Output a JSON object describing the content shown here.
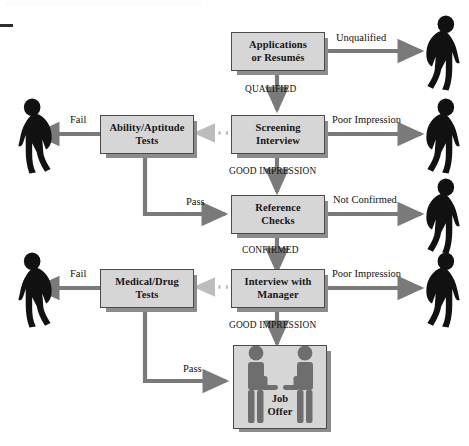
{
  "diagram": {
    "colors": {
      "box_fill": "#d6d6d6",
      "box_border": "#4a4a4a",
      "box_shadow": "#8c8c8c",
      "arrow": "#7a7a7a",
      "dotted_arrow": "#bdbdbd",
      "figure_reject": "#111111",
      "figure_offer": "#6e6e6e",
      "text": "#111111",
      "background": "#ffffff"
    },
    "boxes": [
      {
        "id": "applications",
        "line1": "Applications",
        "line2": "or Resumés"
      },
      {
        "id": "screening",
        "line1": "Screening",
        "line2": "Interview"
      },
      {
        "id": "reference",
        "line1": "Reference",
        "line2": "Checks"
      },
      {
        "id": "manager",
        "line1": "Interview with",
        "line2": "Manager"
      },
      {
        "id": "ability",
        "line1": "Ability/Aptitude",
        "line2": "Tests"
      },
      {
        "id": "medical",
        "line1": "Medical/Drug",
        "line2": "Tests"
      },
      {
        "id": "offer",
        "line1": "Job",
        "line2": "Offer"
      }
    ],
    "edge_labels": {
      "unqualified": "Unqualified",
      "qualified": "QUALIFIED",
      "poor_impression_1": "Poor Impression",
      "good_impression_1": "GOOD IMPRESSION",
      "not_confirmed": "Not Confirmed",
      "confirmed": "CONFIRMED",
      "poor_impression_2": "Poor Impression",
      "good_impression_2": "GOOD IMPRESSION",
      "fail_1": "Fail",
      "fail_2": "Fail",
      "pass_1": "Pass",
      "pass_2": "Pass"
    },
    "figures": [
      {
        "id": "rejected-unqualified",
        "facing": "right"
      },
      {
        "id": "rejected-poor-impression-screening",
        "facing": "right"
      },
      {
        "id": "rejected-not-confirmed",
        "facing": "right"
      },
      {
        "id": "rejected-poor-impression-manager",
        "facing": "right"
      },
      {
        "id": "rejected-fail-ability",
        "facing": "left"
      },
      {
        "id": "rejected-fail-medical",
        "facing": "left"
      },
      {
        "id": "offer-manager",
        "facing": "right"
      },
      {
        "id": "offer-candidate",
        "facing": "left"
      }
    ]
  }
}
